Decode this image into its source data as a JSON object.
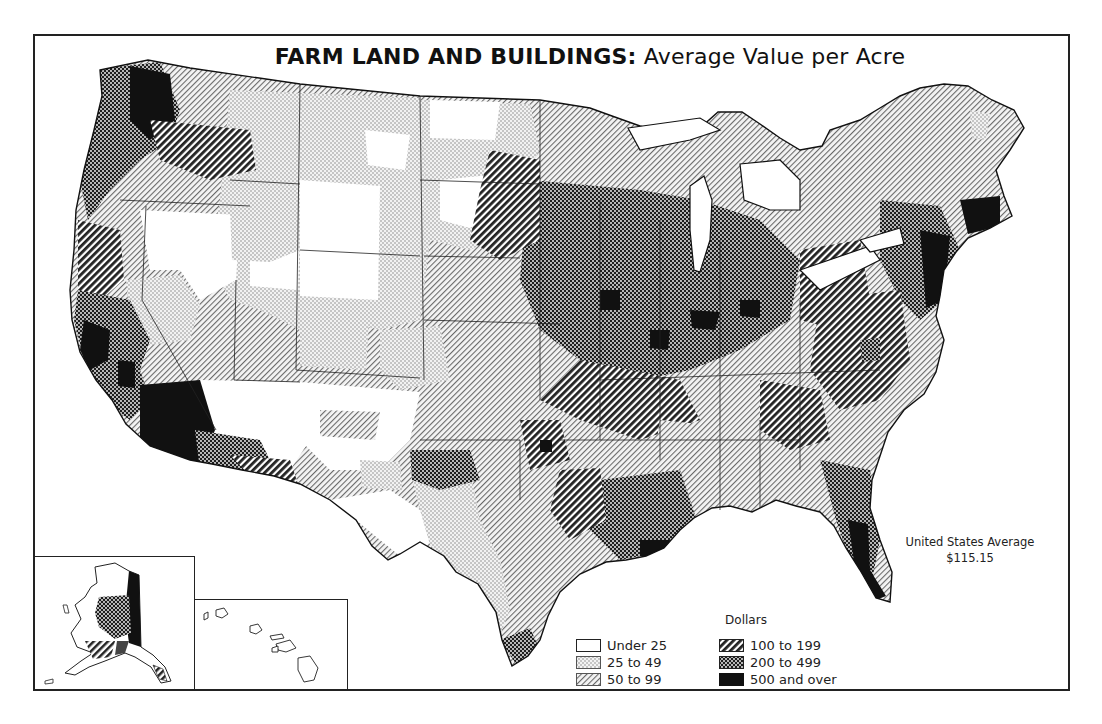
{
  "title": {
    "bold": "FARM LAND AND BUILDINGS:",
    "rest": " Average Value per Acre"
  },
  "note": {
    "label": "United States Average",
    "value": "$115.15"
  },
  "legend": {
    "title": "Dollars",
    "items": [
      {
        "id": "under25",
        "label": "Under 25",
        "pattern": "blank"
      },
      {
        "id": "25to49",
        "label": "25 to 49",
        "pattern": "fine-dots"
      },
      {
        "id": "50to99",
        "label": "50 to 99",
        "pattern": "fine-diagonal"
      },
      {
        "id": "100to199",
        "label": "100 to 199",
        "pattern": "bold-diagonal"
      },
      {
        "id": "200to499",
        "label": "200 to 499",
        "pattern": "dark-checker"
      },
      {
        "id": "500plus",
        "label": "500 and over",
        "pattern": "solid-black"
      }
    ]
  },
  "insets": {
    "alaska": "Alaska",
    "hawaii": "Hawaii"
  },
  "colors": {
    "ink": "#1a1a1a",
    "paper": "#ffffff",
    "dots": "#8a8a8a"
  }
}
